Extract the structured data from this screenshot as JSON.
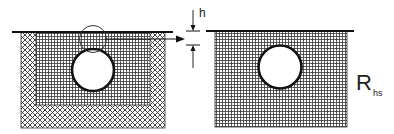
{
  "diagram": {
    "left_figure": {
      "description": "Cross-section: pipe inside fine-grid fill within coarser crosshatch trench, with flow arrow to the right",
      "labels": []
    },
    "dimension": {
      "label": "h"
    },
    "right_figure": {
      "description": "Equivalent homogeneous section with pipe",
      "label_main": "R",
      "label_sub": "hs"
    },
    "colors": {
      "line": "#111111",
      "background": "#ffffff"
    }
  }
}
